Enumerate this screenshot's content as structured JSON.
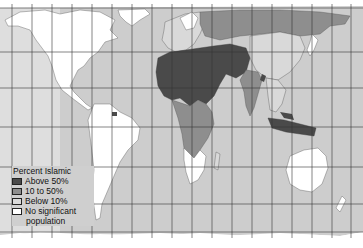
{
  "map": {
    "subject": "Percent Islamic",
    "projection": "Peters equal-area world map",
    "colors": {
      "ocean": "#cdcdcd",
      "grid": "#333333",
      "above_50": "#4a4a4a",
      "10_to_50": "#8e8e8e",
      "below_10": "#d9d9d9",
      "none": "#ffffff"
    }
  },
  "legend": {
    "title": "Percent Islamic",
    "items": [
      {
        "label": "Above 50%",
        "color": "#4a4a4a"
      },
      {
        "label": "10 to 50%",
        "color": "#8e8e8e"
      },
      {
        "label": "Below 10%",
        "color": "#d9d9d9"
      },
      {
        "label": "No significant",
        "color": "#ffffff"
      }
    ],
    "continuation": "population"
  }
}
